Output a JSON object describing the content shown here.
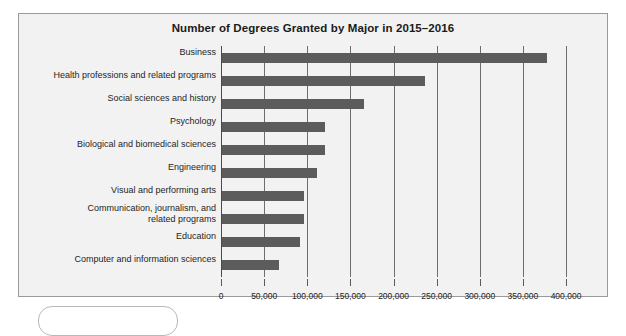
{
  "chart_data": {
    "type": "bar",
    "orientation": "horizontal",
    "title": "Number of Degrees Granted by Major in 2015–2016",
    "xlabel": "",
    "ylabel": "",
    "xlim": [
      0,
      400000
    ],
    "grid": true,
    "legend": false,
    "bar_color": "#5c5c5c",
    "background_color": "#f2f2f2",
    "tick_labels": [
      "0",
      "50,000",
      "100,000",
      "150,000",
      "200,000",
      "250,000",
      "300,000",
      "350,000",
      "400,000"
    ],
    "tick_values": [
      0,
      50000,
      100000,
      150000,
      200000,
      250000,
      300000,
      350000,
      400000
    ],
    "categories": [
      "Business",
      "Health professions and related programs",
      "Social sciences and history",
      "Psychology",
      "Biological and biomedical sciences",
      "Engineering",
      "Visual and performing arts",
      "Communication, journalism, and\nrelated programs",
      "Education",
      "Computer and information sciences"
    ],
    "values": [
      377000,
      235000,
      165000,
      119000,
      119000,
      110000,
      95000,
      95000,
      90000,
      66000
    ]
  }
}
